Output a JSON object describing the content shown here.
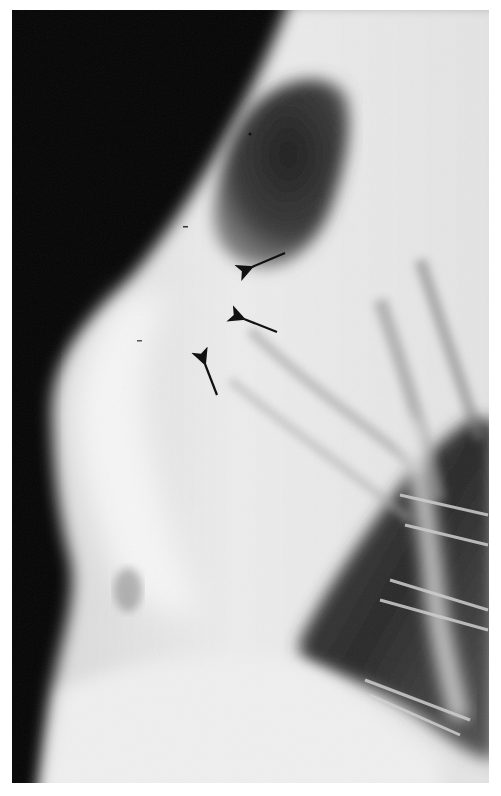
{
  "image": {
    "type": "radiograph",
    "view": "lateral chest",
    "palette": {
      "background_air": "#050505",
      "soft_tissue": "#e8e8e8",
      "lung_dark": "#2a2a2a",
      "lung_lower": "#3a3a3a",
      "bone": "#f4f4f4",
      "arrow": "#111111",
      "border": "#ffffff"
    },
    "annotations": {
      "arrows": [
        {
          "label": "arrow-1",
          "tip": [
            248,
            268
          ],
          "tail": [
            285,
            253
          ]
        },
        {
          "label": "arrow-2",
          "tip": [
            240,
            318
          ],
          "tail": [
            277,
            332
          ]
        },
        {
          "label": "arrow-3",
          "tip": [
            203,
            360
          ],
          "tail": [
            217,
            395
          ]
        }
      ]
    }
  }
}
